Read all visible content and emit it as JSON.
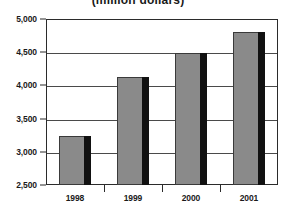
{
  "chart_data": {
    "type": "bar",
    "title": "(million dollars)",
    "xlabel": "",
    "ylabel": "",
    "categories": [
      "1998",
      "1999",
      "2000",
      "2001"
    ],
    "values": [
      3240,
      4120,
      4490,
      4810
    ],
    "series": [
      {
        "name": "",
        "values": [
          3240,
          4120,
          4490,
          4810
        ]
      }
    ],
    "ylim": [
      2500,
      5000
    ],
    "ytick_labels": [
      "5,000",
      "4,500",
      "4,000",
      "3,500",
      "3,000",
      "2,500"
    ],
    "ytick_values": [
      5000,
      4500,
      4000,
      3500,
      3000,
      2500
    ],
    "grid": true,
    "legend": "none",
    "colors": {
      "bar_fill": "#8a8a8a",
      "bar_shadow": "#111111",
      "bar_border": "#3a3a3a",
      "frame": "#2b2b2b",
      "gridline": "#4a4a4a",
      "text": "#1a1a1a",
      "background": "#ffffff"
    }
  }
}
